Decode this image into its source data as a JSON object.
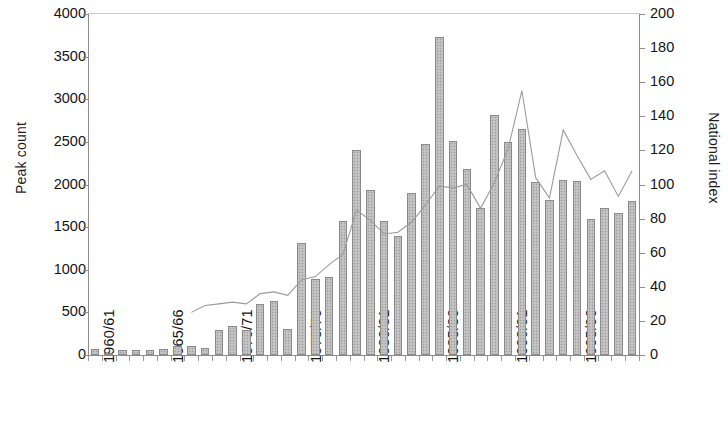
{
  "chart_data": {
    "type": "bar",
    "title": "",
    "subtitle": "",
    "xlabel": "",
    "ylabel": "Peak count",
    "y2label": "National index",
    "ylim": [
      0,
      4000
    ],
    "y2lim": [
      0,
      200
    ],
    "grid": false,
    "legend": "none",
    "y_ticks": [
      "0",
      "500",
      "1000",
      "1500",
      "2000",
      "2500",
      "3000",
      "3500",
      "4000"
    ],
    "y_tick_values": [
      0,
      500,
      1000,
      1500,
      2000,
      2500,
      3000,
      3500,
      4000
    ],
    "y2_ticks": [
      "0",
      "20",
      "40",
      "60",
      "80",
      "100",
      "120",
      "140",
      "160",
      "180",
      "200"
    ],
    "y2_tick_values": [
      0,
      20,
      40,
      60,
      80,
      100,
      120,
      140,
      160,
      180,
      200
    ],
    "categories": [
      "1960/61",
      "1961/62",
      "1962/63",
      "1963/64",
      "1964/65",
      "1965/66",
      "1966/67",
      "1967/68",
      "1968/69",
      "1969/70",
      "1970/71",
      "1971/72",
      "1972/73",
      "1973/74",
      "1974/75",
      "1975/76",
      "1976/77",
      "1977/78",
      "1978/79",
      "1979/80",
      "1980/81",
      "1981/82",
      "1982/83",
      "1983/84",
      "1984/85",
      "1985/86",
      "1986/87",
      "1987/88",
      "1988/89",
      "1989/90",
      "1990/91",
      "1991/92",
      "1992/93",
      "1993/94",
      "1994/95",
      "1995/96",
      "1996/97",
      "1997/98",
      "1998/99",
      "1999/00"
    ],
    "x_tick_labels": [
      "1960/61",
      "1965/66",
      "1970/71",
      "1975/76",
      "1980/81",
      "1985/86",
      "1990/91",
      "1995/96"
    ],
    "x_tick_indices": [
      0,
      5,
      10,
      15,
      20,
      25,
      30,
      35
    ],
    "series": [
      {
        "name": "Peak count",
        "type": "bar",
        "axis": "left",
        "fill": "#bdbdbd",
        "border": "#8a8a8a",
        "values": [
          70,
          20,
          60,
          60,
          60,
          70,
          100,
          100,
          80,
          290,
          340,
          290,
          600,
          630,
          310,
          1310,
          890,
          910,
          1570,
          2400,
          1940,
          1570,
          1400,
          1900,
          2480,
          3730,
          2510,
          2180,
          1730,
          2810,
          2500,
          2650,
          2030,
          1820,
          2050,
          2040,
          1600,
          1730,
          1670,
          1810
        ]
      },
      {
        "name": "National index",
        "type": "line",
        "axis": "right",
        "color": "#9b9b9b",
        "start_index": 7,
        "values": [
          null,
          null,
          null,
          null,
          null,
          null,
          null,
          25,
          29,
          30,
          31,
          30,
          36,
          37,
          35,
          44,
          46,
          53,
          59,
          85,
          79,
          71,
          72,
          78,
          88,
          99,
          98,
          100,
          86,
          101,
          121,
          155,
          104,
          92,
          132,
          117,
          103,
          108,
          93,
          108
        ]
      }
    ]
  },
  "axes": {
    "left_title": "Peak count",
    "right_title": "National index"
  }
}
